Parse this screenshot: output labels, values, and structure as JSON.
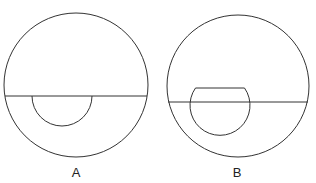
{
  "figures": [
    {
      "label": "A",
      "outer_circle": {
        "cx": 76,
        "cy": 85,
        "r": 72
      },
      "line_y": 96,
      "inner_shape": "semicircle below line",
      "inner": {
        "cx": 62,
        "cy": 96,
        "r": 30
      }
    },
    {
      "label": "B",
      "outer_circle": {
        "cx": 238,
        "cy": 86,
        "r": 71
      },
      "line_y": 102,
      "inner_shape": "truncated circle crossing line",
      "inner": {
        "cx": 220,
        "cy": 108,
        "r": 30,
        "top_y": 88
      }
    }
  ],
  "colors": {
    "stroke": "#333333",
    "background": "#ffffff"
  }
}
